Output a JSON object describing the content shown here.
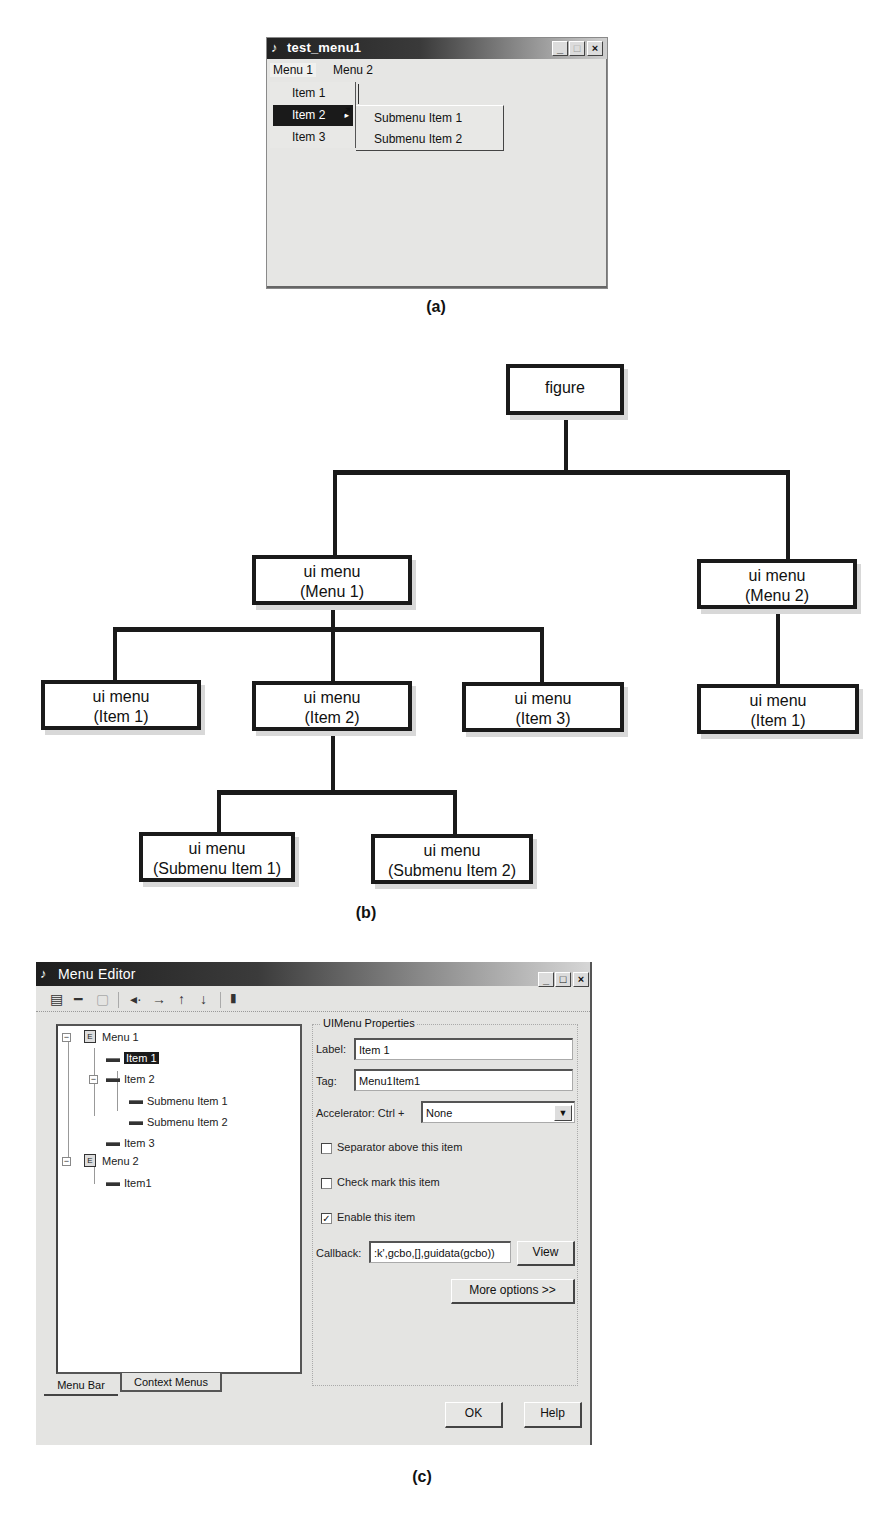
{
  "panel_a": {
    "caption": "(a)",
    "window": {
      "title": "test_menu1",
      "title_icon": "matlab-icon",
      "controls": [
        "_",
        "□",
        "×"
      ]
    },
    "menubar": [
      {
        "label": "Menu 1",
        "open": true
      },
      {
        "label": "Menu 2",
        "open": false
      }
    ],
    "dropdown": [
      {
        "label": "Item 1",
        "selected": false,
        "has_submenu": false
      },
      {
        "label": "Item 2",
        "selected": true,
        "has_submenu": true,
        "arrow": "▸"
      },
      {
        "label": "Item 3",
        "selected": false,
        "has_submenu": false
      }
    ],
    "submenu": [
      {
        "label": "Submenu Item 1"
      },
      {
        "label": "Submenu Item 2"
      }
    ],
    "cursor": "arrow-pointer"
  },
  "panel_b": {
    "caption": "(b)",
    "root": {
      "line1": "figure"
    },
    "menu1": {
      "line1": "ui menu",
      "line2": "(Menu 1)"
    },
    "menu2": {
      "line1": "ui menu",
      "line2": "(Menu 2)"
    },
    "m1_item1": {
      "line1": "ui menu",
      "line2": "(Item 1)"
    },
    "m1_item2": {
      "line1": "ui menu",
      "line2": "(Item 2)"
    },
    "m1_item3": {
      "line1": "ui menu",
      "line2": "(Item 3)"
    },
    "m2_item1": {
      "line1": "ui menu",
      "line2": "(Item 1)"
    },
    "sub1": {
      "line1": "ui menu",
      "line2": "(Submenu Item 1)"
    },
    "sub2": {
      "line1": "ui menu",
      "line2": "(Submenu Item 2)"
    }
  },
  "panel_c": {
    "caption": "(c)",
    "window": {
      "title": "Menu Editor",
      "controls": [
        "_",
        "□",
        "×"
      ]
    },
    "toolbar": [
      {
        "name": "new-menu-icon",
        "glyph": "▤"
      },
      {
        "name": "new-menu-item-icon",
        "glyph": "━"
      },
      {
        "name": "new-context-menu-icon",
        "glyph": "▢"
      },
      {
        "name": "move-left-icon",
        "glyph": "◂·"
      },
      {
        "name": "move-right-icon",
        "glyph": "→"
      },
      {
        "name": "move-up-icon",
        "glyph": "↑"
      },
      {
        "name": "move-down-icon",
        "glyph": "↓"
      },
      {
        "name": "delete-icon",
        "glyph": "🗑"
      }
    ],
    "tree": [
      {
        "label": "Menu 1",
        "type": "menu",
        "level": 0,
        "expander": "−"
      },
      {
        "label": "Item 1",
        "type": "item",
        "level": 1,
        "selected": true
      },
      {
        "label": "Item 2",
        "type": "item",
        "level": 1,
        "expander": "−"
      },
      {
        "label": "Submenu Item 1",
        "type": "item",
        "level": 2
      },
      {
        "label": "Submenu Item 2",
        "type": "item",
        "level": 2
      },
      {
        "label": "Item 3",
        "type": "item",
        "level": 1
      },
      {
        "label": "Menu 2",
        "type": "menu",
        "level": 0,
        "expander": "−"
      },
      {
        "label": "Item1",
        "type": "item",
        "level": 1
      }
    ],
    "tabs": [
      {
        "label": "Menu Bar",
        "active": true
      },
      {
        "label": "Context Menus",
        "active": false
      }
    ],
    "properties": {
      "group_title": "UIMenu Properties",
      "label_label": "Label:",
      "label_value": "Item 1",
      "tag_label": "Tag:",
      "tag_value": "Menu1Item1",
      "accelerator_label": "Accelerator: Ctrl +",
      "accelerator_value": "None",
      "separator_label": "Separator above this item",
      "separator_checked": false,
      "checkmark_label": "Check mark this item",
      "checkmark_checked": false,
      "enable_label": "Enable this item",
      "enable_checked": true,
      "callback_label": "Callback:",
      "callback_value": ":k',gcbo,[],guidata(gcbo))",
      "view_button": "View",
      "more_options_button": "More options >>"
    },
    "ok_button": "OK",
    "help_button": "Help"
  }
}
